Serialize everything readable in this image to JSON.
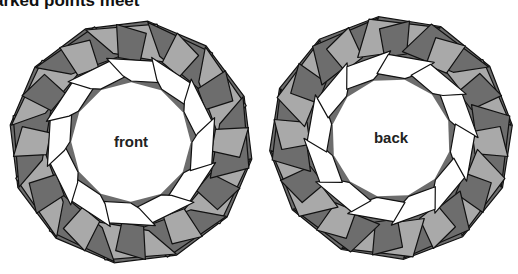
{
  "caption": "arked points meet",
  "colors": {
    "light": "#a9a9a9",
    "dark": "#6d6d6d",
    "outline": "#111111",
    "inner": "#ffffff"
  },
  "models": [
    {
      "label": "front",
      "cx": 131,
      "cy": 142,
      "r": 122,
      "rotation": 8,
      "mirror": false
    },
    {
      "label": "back",
      "cx": 391,
      "cy": 138,
      "r": 122,
      "rotation": -6,
      "mirror": true
    }
  ]
}
